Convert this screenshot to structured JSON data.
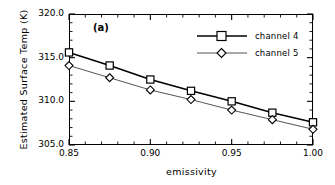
{
  "figure": {
    "panel_label": "(a)",
    "background": "#ffffff",
    "axis_color": "#000000"
  },
  "chart_data": {
    "type": "line",
    "title": "",
    "panel": "(a)",
    "xlabel": "emissivity",
    "ylabel": "Estimated Surface Temp (K)",
    "xlim": [
      0.85,
      1.0
    ],
    "ylim": [
      305.0,
      320.0
    ],
    "xticks": [
      0.85,
      0.9,
      0.95,
      1.0
    ],
    "xtick_labels": [
      "0.85",
      "0.90",
      "0.95",
      "1.00"
    ],
    "yticks": [
      305.0,
      310.0,
      315.0,
      320.0
    ],
    "ytick_labels": [
      "305.0",
      "310.0",
      "315.0",
      "320.0"
    ],
    "minor_ticks": true,
    "grid": false,
    "legend_position": "upper right",
    "x": [
      0.85,
      0.875,
      0.9,
      0.925,
      0.95,
      0.975,
      1.0
    ],
    "series": [
      {
        "name": "channel 4",
        "marker": "square-open",
        "color": "#000000",
        "linewidth": 1.6,
        "values": [
          315.6,
          314.1,
          312.5,
          311.2,
          310.0,
          308.7,
          307.6
        ]
      },
      {
        "name": "channel 5",
        "marker": "diamond-open",
        "color": "#555555",
        "linewidth": 1.0,
        "values": [
          314.1,
          312.7,
          311.3,
          310.2,
          309.0,
          307.9,
          306.8
        ]
      }
    ]
  },
  "legend": {
    "entries": [
      {
        "label": "channel 4"
      },
      {
        "label": "channel 5"
      }
    ]
  }
}
